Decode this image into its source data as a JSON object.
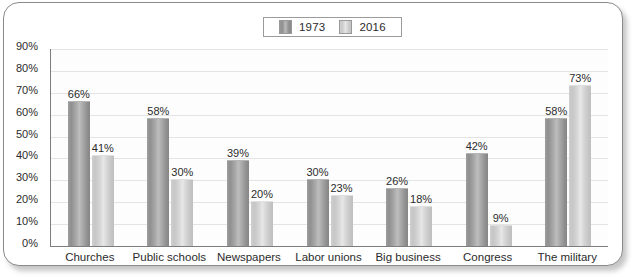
{
  "chart_data": {
    "type": "bar",
    "title": "",
    "xlabel": "",
    "ylabel": "",
    "ylim": [
      0,
      90
    ],
    "ytick_labels": [
      "90%",
      "80%",
      "70%",
      "60%",
      "50%",
      "40%",
      "30%",
      "20%",
      "10%",
      "0%"
    ],
    "ytick_values": [
      90,
      80,
      70,
      60,
      50,
      40,
      30,
      20,
      10,
      0
    ],
    "grid": true,
    "legend_position": "top-center",
    "categories": [
      "Churches",
      "Public schools",
      "Newspapers",
      "Labor unions",
      "Big business",
      "Congress",
      "The military"
    ],
    "series": [
      {
        "name": "1973",
        "color": "#9a9a9a",
        "values": [
          66,
          58,
          39,
          30,
          26,
          42,
          58
        ],
        "labels": [
          "66%",
          "58%",
          "39%",
          "30%",
          "26%",
          "42%",
          "58%"
        ]
      },
      {
        "name": "2016",
        "color": "#d0d0d0",
        "values": [
          41,
          30,
          20,
          23,
          18,
          9,
          73
        ],
        "labels": [
          "41%",
          "30%",
          "20%",
          "23%",
          "18%",
          "9%",
          "73%"
        ]
      }
    ]
  },
  "legend": {
    "entries": [
      {
        "label": "1973",
        "swatch": "dark-gray-swatch"
      },
      {
        "label": "2016",
        "swatch": "light-gray-swatch"
      }
    ]
  }
}
